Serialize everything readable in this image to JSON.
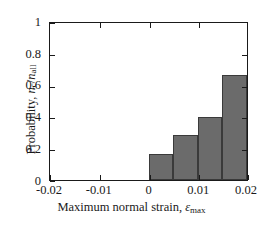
{
  "chart_data": {
    "type": "bar",
    "title": "",
    "subtitle": "",
    "xlabel": "Maximum normal strain, εmax",
    "ylabel": "Probability, nc/nall",
    "xlim": [
      -0.02,
      0.02
    ],
    "ylim": [
      0,
      1
    ],
    "grid": false,
    "legend": null,
    "bar_edges": [
      0.0,
      0.005,
      0.01,
      0.015,
      0.02
    ],
    "categories": [
      "0–0.005",
      "0.005–0.01",
      "0.01–0.015",
      "0.015–0.02"
    ],
    "values": [
      0.167,
      0.286,
      0.4,
      0.667
    ],
    "bar_color": "#6b6b6b",
    "bar_edge_color": "#3a3a3a",
    "xticks": [
      -0.02,
      -0.01,
      0,
      0.01,
      0.02
    ],
    "xtick_labels": [
      "-0.02",
      "-0.01",
      "0",
      "0.01",
      "0.02"
    ],
    "yticks": [
      0,
      0.2,
      0.4,
      0.6,
      0.8,
      1
    ],
    "ytick_labels": [
      "0",
      "0.2",
      "0.4",
      "0.6",
      "0.8",
      "1"
    ]
  },
  "axis_titles": {
    "x_main": "Maximum normal strain, ",
    "x_symbol": "ε",
    "x_symbol_sub": "max",
    "y_main": "Probability, ",
    "y_num": "n",
    "y_num_sub": "c",
    "y_slash": "/",
    "y_den": "n",
    "y_den_sub": "all"
  }
}
